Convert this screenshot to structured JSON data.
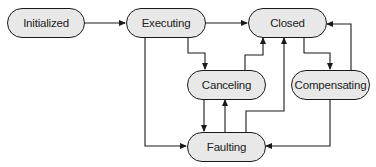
{
  "diagram": {
    "type": "state-machine",
    "nodes": [
      {
        "id": "initialized",
        "label": "Initialized"
      },
      {
        "id": "executing",
        "label": "Executing"
      },
      {
        "id": "closed",
        "label": "Closed"
      },
      {
        "id": "canceling",
        "label": "Canceling"
      },
      {
        "id": "compensating",
        "label": "Compensating"
      },
      {
        "id": "faulting",
        "label": "Faulting"
      }
    ],
    "edges": [
      {
        "from": "Initialized",
        "to": "Executing"
      },
      {
        "from": "Executing",
        "to": "Closed"
      },
      {
        "from": "Executing",
        "to": "Canceling"
      },
      {
        "from": "Executing",
        "to": "Faulting"
      },
      {
        "from": "Canceling",
        "to": "Closed"
      },
      {
        "from": "Canceling",
        "to": "Faulting"
      },
      {
        "from": "Faulting",
        "to": "Canceling"
      },
      {
        "from": "Faulting",
        "to": "Closed"
      },
      {
        "from": "Closed",
        "to": "Compensating"
      },
      {
        "from": "Compensating",
        "to": "Closed"
      },
      {
        "from": "Compensating",
        "to": "Faulting"
      }
    ],
    "colors": {
      "node_fill": "#e8e8e8",
      "stroke": "#1a1a1a"
    }
  }
}
